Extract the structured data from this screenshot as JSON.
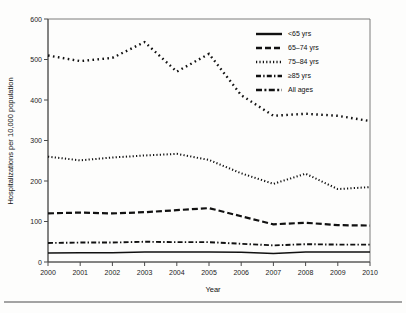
{
  "figure": {
    "background_color": "#fdfdfc",
    "ink_color": "#111111",
    "axis_color": "#4a4a4a"
  },
  "axes": {
    "y_title": "Hospitalizations per 10,000 population",
    "x_title": "Year",
    "y_ticks": [
      "0",
      "100",
      "200",
      "300",
      "400",
      "500",
      "600"
    ],
    "x_ticks": [
      "2000",
      "2001",
      "2002",
      "2003",
      "2004",
      "2005",
      "2006",
      "2007",
      "2008",
      "2009",
      "2010"
    ]
  },
  "legend": {
    "items": [
      {
        "label": "<65 yrs",
        "style": "solid"
      },
      {
        "label": "65–74 yrs",
        "style": "dashed"
      },
      {
        "label": "75–84 yrs",
        "style": "dotted"
      },
      {
        "label": "≥85 yrs",
        "style": "dash-dot"
      },
      {
        "label": "All ages",
        "style": "dash-dot-long"
      }
    ]
  },
  "chart_data": {
    "type": "line",
    "title": "",
    "subtitle": "",
    "xlabel": "Year",
    "ylabel": "Hospitalizations per 10,000 population",
    "x": [
      2000,
      2001,
      2002,
      2003,
      2004,
      2005,
      2006,
      2007,
      2008,
      2009,
      2010
    ],
    "xlim": [
      2000,
      2010
    ],
    "ylim": [
      0,
      600
    ],
    "y_tick_step": 100,
    "grid": false,
    "legend_position": "top-right",
    "series": [
      {
        "name": "≥85 yrs",
        "style": "dotted-sparse",
        "values": [
          510,
          496,
          504,
          543,
          470,
          514,
          412,
          361,
          366,
          361,
          348
        ]
      },
      {
        "name": "75–84 yrs",
        "style": "dotted-fine",
        "values": [
          260,
          251,
          258,
          263,
          267,
          252,
          219,
          193,
          218,
          180,
          185
        ]
      },
      {
        "name": "65–74 yrs",
        "style": "dashed",
        "values": [
          120,
          122,
          120,
          123,
          128,
          133,
          113,
          93,
          97,
          91,
          90
        ]
      },
      {
        "name": "All ages",
        "style": "dash-dot",
        "values": [
          47,
          48,
          48,
          50,
          49,
          49,
          45,
          41,
          44,
          43,
          43
        ]
      },
      {
        "name": "<65 yrs",
        "style": "solid",
        "values": [
          22,
          23,
          23,
          25,
          25,
          25,
          24,
          21,
          25,
          25,
          25
        ]
      }
    ]
  }
}
